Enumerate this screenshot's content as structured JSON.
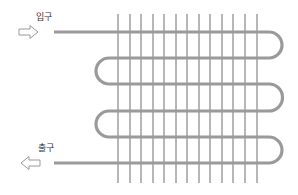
{
  "diagram": {
    "type": "serpentine-coil-heat-exchanger",
    "inlet": {
      "label": "입구",
      "arrow": "right-arrow-icon"
    },
    "outlet": {
      "label": "출구",
      "arrow": "left-arrow-icon"
    },
    "colors": {
      "pipe": "#9a9a9a",
      "fin": "#6e6e6e",
      "arrow": "#9a9a9a"
    },
    "fin_count": 13,
    "pipe_pass_count": 6
  }
}
